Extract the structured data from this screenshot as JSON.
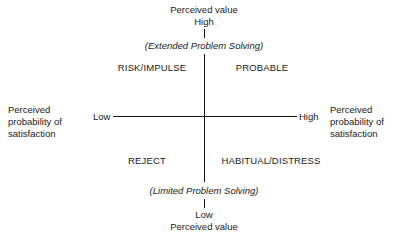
{
  "diagram": {
    "type": "2x2-perceptual-matrix",
    "background_color": "#ffffff",
    "line_color": "#161616",
    "text_color": "#1a1a1a",
    "vertical_axis": {
      "label": "Perceived value",
      "top_end_label": "High",
      "bottom_end_label": "Low",
      "top_annotation": "(Extended Problem Solving)",
      "bottom_annotation": "(Limited Problem Solving)"
    },
    "horizontal_axis": {
      "left_label_line1": "Perceived",
      "left_label_line2": "probability of",
      "left_label_line3": "satisfaction",
      "right_label_line1": "Perceived",
      "right_label_line2": "probability of",
      "right_label_line3": "satisfaction",
      "left_end_label": "Low",
      "right_end_label": "High"
    },
    "quadrants": [
      {
        "id": "top-left",
        "label": "RISK/IMPULSE"
      },
      {
        "id": "top-right",
        "label": "PROBABLE"
      },
      {
        "id": "bottom-left",
        "label": "REJECT"
      },
      {
        "id": "bottom-right",
        "label": "HABITUAL/DISTRESS"
      }
    ]
  }
}
